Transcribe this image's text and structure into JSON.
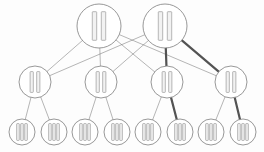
{
  "diagram": {
    "type": "node-link-tree",
    "canvas": {
      "width": 264,
      "height": 152,
      "background": "#fdfdfd"
    },
    "style": {
      "node_stroke": "#7d7d7d",
      "node_fill": "#ffffff",
      "bar_stroke": "#9a9a9a",
      "bar_fill": "#f2f2f2",
      "edge_color": "#6f6f6f",
      "edge_width": 0.6,
      "highlight_color": "#4a4a4a",
      "highlight_width": 2.2
    },
    "levels": [
      {
        "name": "root-level",
        "index": 0,
        "radius": 22,
        "bars": 2,
        "cy": 26,
        "nodes": [
          {
            "id": "r0",
            "label": "",
            "cx": 99
          },
          {
            "id": "r1",
            "label": "",
            "cx": 165
          }
        ]
      },
      {
        "name": "middle-level",
        "index": 1,
        "radius": 16,
        "bars": 2,
        "cy": 82,
        "nodes": [
          {
            "id": "m0",
            "label": "",
            "cx": 35
          },
          {
            "id": "m1",
            "label": "",
            "cx": 101
          },
          {
            "id": "m2",
            "label": "",
            "cx": 167
          },
          {
            "id": "m3",
            "label": "",
            "cx": 231
          }
        ]
      },
      {
        "name": "leaf-level",
        "index": 2,
        "radius": 13,
        "bars": 3,
        "cy": 132,
        "nodes": [
          {
            "id": "l0",
            "label": "",
            "cx": 22
          },
          {
            "id": "l1",
            "label": "",
            "cx": 54
          },
          {
            "id": "l2",
            "label": "",
            "cx": 85
          },
          {
            "id": "l3",
            "label": "",
            "cx": 117
          },
          {
            "id": "l4",
            "label": "",
            "cx": 148
          },
          {
            "id": "l5",
            "label": "",
            "cx": 180
          },
          {
            "id": "l6",
            "label": "",
            "cx": 211
          },
          {
            "id": "l7",
            "label": "",
            "cx": 243
          }
        ]
      }
    ],
    "edges": [
      {
        "from": "r0",
        "to": "m0",
        "highlight": false
      },
      {
        "from": "r0",
        "to": "m1",
        "highlight": false
      },
      {
        "from": "r0",
        "to": "m2",
        "highlight": false
      },
      {
        "from": "r0",
        "to": "m3",
        "highlight": false
      },
      {
        "from": "r1",
        "to": "m0",
        "highlight": false
      },
      {
        "from": "r1",
        "to": "m1",
        "highlight": false
      },
      {
        "from": "r1",
        "to": "m2",
        "highlight": true
      },
      {
        "from": "r1",
        "to": "m3",
        "highlight": true
      },
      {
        "from": "m0",
        "to": "l0",
        "highlight": false
      },
      {
        "from": "m0",
        "to": "l1",
        "highlight": false
      },
      {
        "from": "m1",
        "to": "l2",
        "highlight": false
      },
      {
        "from": "m1",
        "to": "l3",
        "highlight": false
      },
      {
        "from": "m2",
        "to": "l4",
        "highlight": false
      },
      {
        "from": "m2",
        "to": "l5",
        "highlight": true
      },
      {
        "from": "m3",
        "to": "l6",
        "highlight": false
      },
      {
        "from": "m3",
        "to": "l7",
        "highlight": true
      }
    ]
  }
}
